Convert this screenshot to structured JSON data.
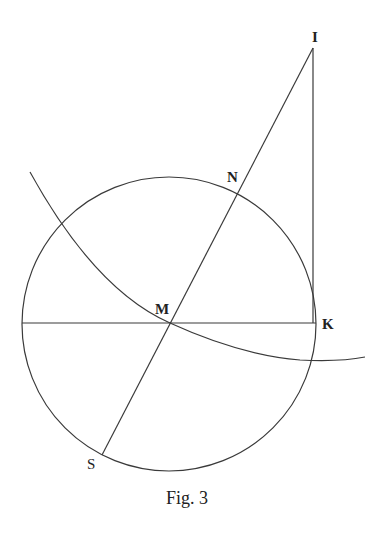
{
  "figure": {
    "caption": "Fig. 3",
    "points": {
      "I": "I",
      "N": "N",
      "M": "M",
      "K": "K",
      "S": "S"
    },
    "elements": [
      "circle centered at M",
      "diameter through M to K (horizontal)",
      "line S-M-N-I through center",
      "vertical line I-K tangent at K",
      "arc passing through M crossing the circle"
    ],
    "stroke_color": "#3a3a3a",
    "background_color": "#ffffff"
  }
}
